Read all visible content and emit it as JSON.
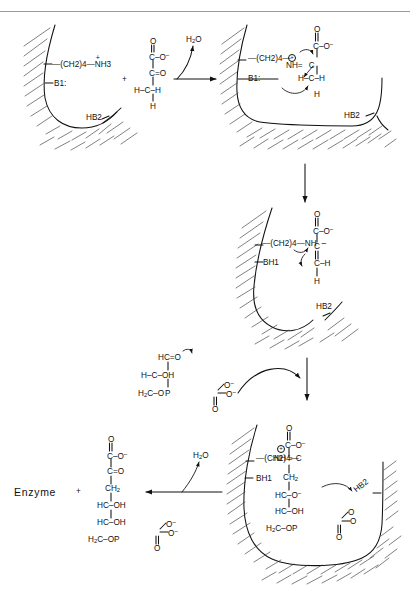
{
  "figure": {
    "domain": "reaction-mechanism-diagram",
    "title_visible": false,
    "ink_color": "#111111",
    "paper_color": "#ffffff",
    "rule_color": "#9a9a9a"
  },
  "panel1": {
    "name": "enzyme-active-site-free",
    "lysine_chain": "—(CH2)4—",
    "lysine_amine": "NH3",
    "lysine_amine_charge": "+",
    "base1": "B1:",
    "base2": "HB2"
  },
  "substrate_pyruvate": {
    "name": "pyruvate",
    "lines": [
      {
        "text": "O",
        "kind": "atom"
      },
      {
        "text": "C–O",
        "charge": "−"
      },
      {
        "text": "C=O"
      },
      {
        "text": "H–C–H"
      },
      {
        "text": "H"
      }
    ],
    "plus_sign": "+"
  },
  "arrow1": {
    "label": "H2O",
    "direction": "right"
  },
  "panel2": {
    "name": "schiff-base-iminium-intermediate",
    "lysine_chain": "—(CH2)4—",
    "imine": "NH",
    "imine_charge": "+",
    "bond": "=",
    "carbon": "C",
    "base1": "B1:",
    "base2": "HB2",
    "carboxyl_top": "O",
    "carboxyl": "C–O",
    "carboxyl_charge": "−",
    "methylene": "H–C–H",
    "methylene_h": "H"
  },
  "arrow2": {
    "direction": "down"
  },
  "panel3": {
    "name": "enamine-carbanion-intermediate",
    "lysine_chain": "—(CH2)4—",
    "amine": "NH",
    "base1": "BH1",
    "base2": "HB2",
    "carboxyl_top": "O",
    "carboxyl": "C–O",
    "carboxyl_charge": "−",
    "alpha_carbon": "C",
    "enamine_bond": "=",
    "beta_carbon": "C–H",
    "beta_h": "H"
  },
  "substrate_g3p": {
    "name": "glyceraldehyde-3-phosphate",
    "line1": "HC=O",
    "line2": "H–C–OH",
    "line3_left": "H2C–O",
    "phosphorus": "P",
    "p_o_minus_1": "O",
    "p_o_minus_2": "O",
    "p_charge_1": "−",
    "p_charge_2": "−",
    "p_double_o": "O"
  },
  "arrow3": {
    "direction": "down-curved-into-panel4"
  },
  "panel4": {
    "name": "aldol-adduct-bound-to-enzyme",
    "lysine_chain": "—(CH2)4—",
    "imine": "NH",
    "imine_charge": "+",
    "bond": "=",
    "carbon": "C",
    "base1": "BH1",
    "base2": "HB2",
    "carboxyl_top": "O",
    "carboxyl": "C–O",
    "carboxyl_charge": "−",
    "ch2": "CH2",
    "hc_o_minus": "HC–O",
    "hc_o_minus_charge": "−",
    "hc_oh": "HC–OH",
    "h2c_op": "H2C–OP",
    "p_o_minus_1": "O",
    "p_o_minus_2": "O",
    "p_charge_1": "−",
    "p_charge_2": "−",
    "p_double_o": "O"
  },
  "arrow4": {
    "label": "H2O",
    "direction": "left"
  },
  "product": {
    "enzyme_label": "Enzyme",
    "plus_sign": "+",
    "name": "2-keto-3-deoxy-6-phosphogluconate",
    "carboxyl_top": "O",
    "carboxyl": "C–O",
    "carboxyl_charge": "−",
    "keto": "C=O",
    "ch2": "CH2",
    "hc_oh_1": "HC–OH",
    "hc_oh_2": "HC–OH",
    "h2c_op": "H2C–OP",
    "p_o_minus_1": "O",
    "p_o_minus_2": "O",
    "p_charge_1": "−",
    "p_charge_2": "−",
    "p_double_o": "O"
  }
}
